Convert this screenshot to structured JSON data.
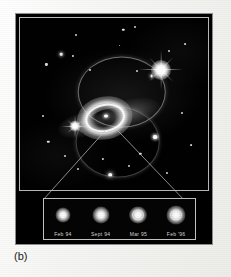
{
  "figure": {
    "caption": "(b)",
    "panel_background": "#000000",
    "frame_color": "#b9b9b9",
    "paper_color": "#fbfbfa"
  },
  "sky_image": {
    "subject": "supernova-1987a",
    "description": "Hubble Space Telescope image of Supernova 1987A showing the bright inner equatorial ring and two fainter outer rings, flanked by two bright foreground stars.",
    "bright_stars": [
      {
        "name": "bright-star-upper-right",
        "x_pct": 75,
        "y_pct": 30,
        "size": 34,
        "spikes": 4
      },
      {
        "name": "bright-star-left",
        "x_pct": 29,
        "y_pct": 63,
        "size": 20,
        "spikes": 4
      }
    ],
    "rings": [
      {
        "name": "outer-ring-upper",
        "x_pct": 54,
        "y_pct": 43,
        "w_pct": 46,
        "h_pct": 40
      },
      {
        "name": "outer-ring-lower",
        "x_pct": 52,
        "y_pct": 72,
        "w_pct": 44,
        "h_pct": 40
      },
      {
        "name": "inner-equatorial-ring",
        "x_pct": 45,
        "y_pct": 58,
        "w_pct": 19,
        "h_pct": 14
      }
    ],
    "field_stars": [
      {
        "x_pct": 14,
        "y_pct": 27,
        "r": 1.1
      },
      {
        "x_pct": 22,
        "y_pct": 21,
        "r": 1.3
      },
      {
        "x_pct": 28,
        "y_pct": 22,
        "r": 1.1
      },
      {
        "x_pct": 30,
        "y_pct": 10,
        "r": 1.0
      },
      {
        "x_pct": 37,
        "y_pct": 30,
        "r": 1.0
      },
      {
        "x_pct": 55,
        "y_pct": 7,
        "r": 1.2
      },
      {
        "x_pct": 61,
        "y_pct": 5,
        "r": 1.0
      },
      {
        "x_pct": 53,
        "y_pct": 16,
        "r": 0.9
      },
      {
        "x_pct": 62,
        "y_pct": 31,
        "r": 1.0
      },
      {
        "x_pct": 70,
        "y_pct": 34,
        "r": 1.4
      },
      {
        "x_pct": 79,
        "y_pct": 19,
        "r": 1.0
      },
      {
        "x_pct": 88,
        "y_pct": 15,
        "r": 0.9
      },
      {
        "x_pct": 12,
        "y_pct": 57,
        "r": 1.0
      },
      {
        "x_pct": 15,
        "y_pct": 72,
        "r": 1.2
      },
      {
        "x_pct": 24,
        "y_pct": 80,
        "r": 1.0
      },
      {
        "x_pct": 31,
        "y_pct": 88,
        "r": 1.0
      },
      {
        "x_pct": 44,
        "y_pct": 82,
        "r": 1.1
      },
      {
        "x_pct": 48,
        "y_pct": 91,
        "r": 1.3
      },
      {
        "x_pct": 64,
        "y_pct": 79,
        "r": 1.2
      },
      {
        "x_pct": 58,
        "y_pct": 86,
        "r": 1.0
      },
      {
        "x_pct": 72,
        "y_pct": 69,
        "r": 1.6
      },
      {
        "x_pct": 86,
        "y_pct": 55,
        "r": 1.0
      },
      {
        "x_pct": 91,
        "y_pct": 74,
        "r": 0.9
      },
      {
        "x_pct": 78,
        "y_pct": 90,
        "r": 1.0
      }
    ]
  },
  "inset": {
    "name": "time-series-strip",
    "description": "Four epochs of the brightening supernova debris, enlarged.",
    "epochs": [
      {
        "label": "Feb  94"
      },
      {
        "label": "Sept 94"
      },
      {
        "label": "Mar  95"
      },
      {
        "label": "Feb '96"
      }
    ]
  }
}
